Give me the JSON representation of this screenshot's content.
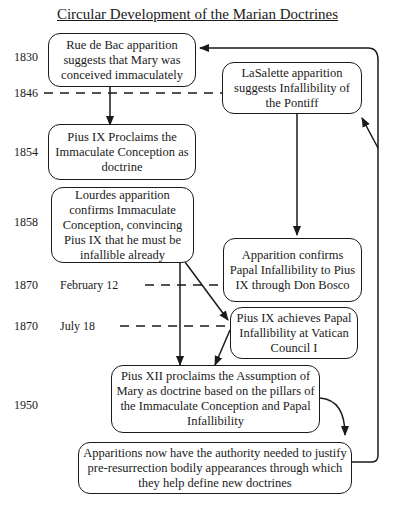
{
  "title": "Circular Development of the Marian Doctrines",
  "years": {
    "y1830": "1830",
    "y1846": "1846",
    "y1854": "1854",
    "y1858": "1858",
    "y1870a": "1870",
    "y1870b": "1870",
    "y1950": "1950"
  },
  "dates": {
    "feb": "February 12",
    "jul": "July 18"
  },
  "boxes": {
    "rue_de_bac": "Rue de Bac apparition suggests that Mary was conceived immaculately",
    "lasalette": "LaSalette apparition suggests Infallibility of the Pontiff",
    "pius_ix_ic": "Pius IX Proclaims the Immaculate Conception as doctrine",
    "lourdes": "Lourdes apparition confirms Immaculate Conception, convincing Pius IX that he must be infallible already",
    "don_bosco": "Apparition confirms Papal Infallibility to Pius IX through Don Bosco",
    "vatican": "Pius IX achieves Papal Infallibility at Vatican Council I",
    "assumption": "Pius XII proclaims the Assumption of Mary as doctrine based on the pillars of the Immaculate Conception and Papal Infallibility",
    "authority": "Apparitions now have the authority needed to justify pre-resurrection bodily appearances through which they help define new doctrines"
  }
}
